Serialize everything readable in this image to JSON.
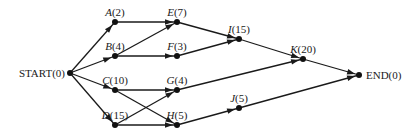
{
  "diagram": {
    "type": "activity-network",
    "colors": {
      "line": "#1a1a1a",
      "node": "#111111",
      "background": "#ffffff"
    },
    "nodes": [
      {
        "id": "START",
        "letter": "START",
        "duration": "(0)",
        "italic": false,
        "x": 70,
        "y": 73,
        "label_pos": "left"
      },
      {
        "id": "A",
        "letter": "A",
        "duration": "(2)",
        "italic": true,
        "x": 115,
        "y": 22,
        "label_pos": "above"
      },
      {
        "id": "B",
        "letter": "B",
        "duration": "(4)",
        "italic": true,
        "x": 115,
        "y": 56,
        "label_pos": "above"
      },
      {
        "id": "C",
        "letter": "C",
        "duration": "(10)",
        "italic": true,
        "x": 115,
        "y": 90,
        "label_pos": "above"
      },
      {
        "id": "D",
        "letter": "D",
        "duration": "(15)",
        "italic": true,
        "x": 115,
        "y": 125,
        "label_pos": "above"
      },
      {
        "id": "E",
        "letter": "E",
        "duration": "(7)",
        "italic": true,
        "x": 177,
        "y": 22,
        "label_pos": "above"
      },
      {
        "id": "F",
        "letter": "F",
        "duration": "(3)",
        "italic": true,
        "x": 177,
        "y": 56,
        "label_pos": "above"
      },
      {
        "id": "G",
        "letter": "G",
        "duration": "(4)",
        "italic": true,
        "x": 177,
        "y": 90,
        "label_pos": "above"
      },
      {
        "id": "H",
        "letter": "H",
        "duration": "(5)",
        "italic": true,
        "x": 177,
        "y": 125,
        "label_pos": "above"
      },
      {
        "id": "I",
        "letter": "I",
        "duration": "(15)",
        "italic": true,
        "x": 239,
        "y": 39,
        "label_pos": "above"
      },
      {
        "id": "J",
        "letter": "J",
        "duration": "(5)",
        "italic": true,
        "x": 239,
        "y": 108,
        "label_pos": "above"
      },
      {
        "id": "K",
        "letter": "K",
        "duration": "(20)",
        "italic": true,
        "x": 303,
        "y": 59,
        "label_pos": "above"
      },
      {
        "id": "END",
        "letter": "END",
        "duration": "(0)",
        "italic": false,
        "x": 359,
        "y": 75,
        "label_pos": "right"
      }
    ],
    "edges": [
      [
        "START",
        "A"
      ],
      [
        "START",
        "B"
      ],
      [
        "START",
        "C"
      ],
      [
        "START",
        "D"
      ],
      [
        "A",
        "E"
      ],
      [
        "B",
        "E"
      ],
      [
        "B",
        "F"
      ],
      [
        "C",
        "G"
      ],
      [
        "C",
        "H"
      ],
      [
        "D",
        "G"
      ],
      [
        "D",
        "H"
      ],
      [
        "E",
        "I"
      ],
      [
        "F",
        "I"
      ],
      [
        "I",
        "K"
      ],
      [
        "G",
        "K"
      ],
      [
        "H",
        "J"
      ],
      [
        "K",
        "END"
      ],
      [
        "J",
        "END"
      ]
    ]
  }
}
